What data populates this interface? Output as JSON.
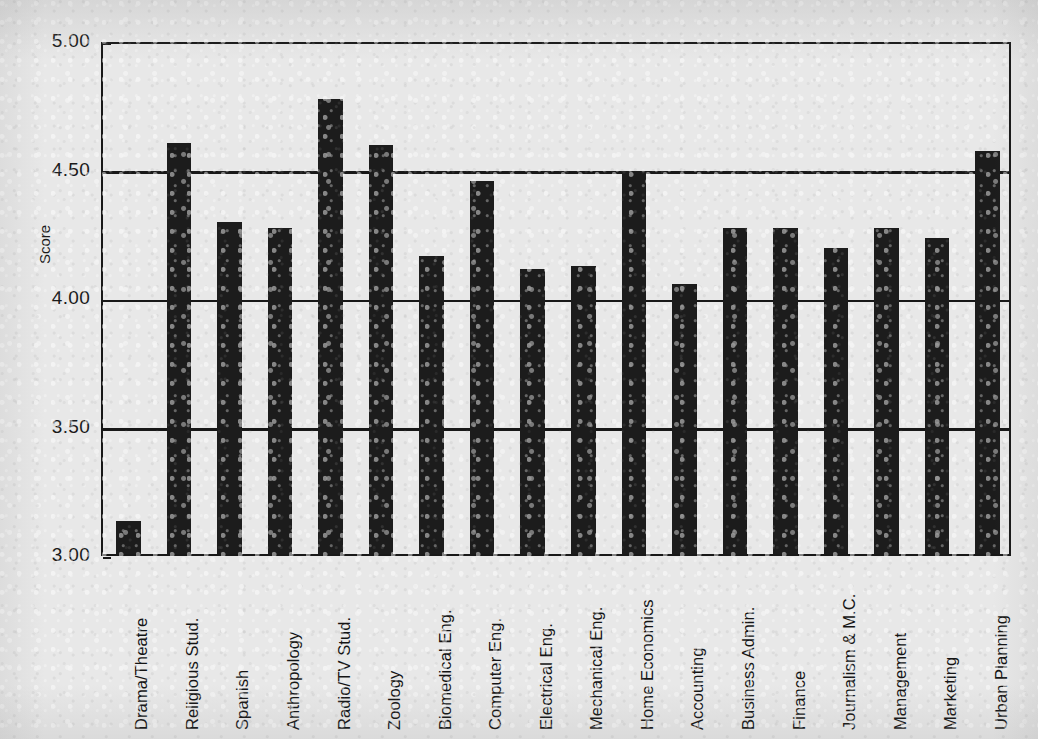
{
  "chart_data": {
    "type": "bar",
    "title": "",
    "xlabel": "",
    "ylabel": "Score",
    "ylim": [
      3.0,
      5.0
    ],
    "ytick_labels": [
      "5.00",
      "4.50",
      "4.00",
      "3.50",
      "3.00"
    ],
    "ytick_values": [
      5.0,
      4.5,
      4.0,
      3.5,
      3.0
    ],
    "grid": true,
    "legend": false,
    "bar_color": "#1c1c1c",
    "categories": [
      "Drama/Theatre",
      "Religious Stud.",
      "Spanish",
      "Anthropology",
      "Radio/TV Stud.",
      "Zoology",
      "Biomedical Eng.",
      "Computer Eng.",
      "Electrical Eng.",
      "Mechanical Eng.",
      "Home Economics",
      "Accounting",
      "Business Admin.",
      "Finance",
      "Journalism & M.C.",
      "Management",
      "Marketing",
      "Urban Planning"
    ],
    "values": [
      3.13,
      4.6,
      4.29,
      4.27,
      4.77,
      4.59,
      4.16,
      4.45,
      4.11,
      4.12,
      4.49,
      4.05,
      4.27,
      4.27,
      4.19,
      4.27,
      4.23,
      4.57
    ]
  },
  "axis": {
    "y_title": "Score"
  }
}
